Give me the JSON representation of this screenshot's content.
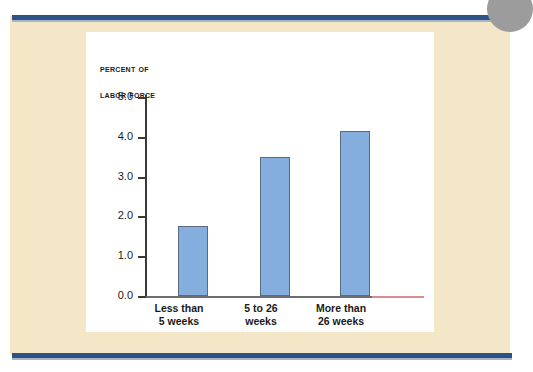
{
  "page": {
    "corner_marker": "page-corner-dot",
    "background_color": "#f3e7c8",
    "rule_color": "#2d5288"
  },
  "chart_data": {
    "type": "bar",
    "title": "PERCENT OF LABOR FORCE",
    "title_lines": [
      "Percent of",
      "Labor Force"
    ],
    "categories": [
      "Less than 5 weeks",
      "5 to 26 weeks",
      "More than 26 weeks"
    ],
    "category_lines": [
      [
        "Less than",
        "5 weeks"
      ],
      [
        "5 to 26",
        "weeks"
      ],
      [
        "More than",
        "26 weeks"
      ]
    ],
    "values": [
      1.75,
      3.5,
      4.15
    ],
    "xlabel": "",
    "ylabel": "Percent of Labor Force",
    "ylim": [
      0.0,
      5.0
    ],
    "ytick_labels": [
      "5.0",
      "4.0",
      "3.0",
      "2.0",
      "1.0",
      "0.0"
    ],
    "ytick_values": [
      5.0,
      4.0,
      3.0,
      2.0,
      1.0,
      0.0
    ],
    "grid": false,
    "legend": false,
    "bar_color": "#84aedd",
    "bar_border_color": "#5a6b80",
    "axis_color": "#3a3a3a"
  }
}
